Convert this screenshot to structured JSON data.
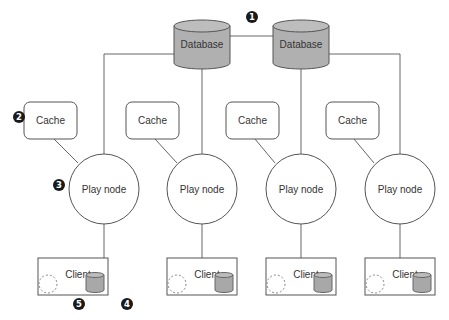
{
  "diagram": {
    "databases": [
      {
        "label": "Database",
        "cx": 202,
        "top": 20
      },
      {
        "label": "Database",
        "cx": 301,
        "top": 20
      }
    ],
    "caches": [
      {
        "label": "Cache",
        "x": 24,
        "y": 102
      },
      {
        "label": "Cache",
        "x": 126,
        "y": 102
      },
      {
        "label": "Cache",
        "x": 226,
        "y": 102
      },
      {
        "label": "Cache",
        "x": 326,
        "y": 102
      }
    ],
    "play_nodes": [
      {
        "label": "Play node",
        "cx": 104,
        "cy": 189
      },
      {
        "label": "Play node",
        "cx": 202,
        "cy": 189
      },
      {
        "label": "Play node",
        "cx": 301,
        "cy": 189
      },
      {
        "label": "Play node",
        "cx": 400,
        "cy": 189
      }
    ],
    "clients": [
      {
        "label": "Client",
        "x": 38,
        "y": 258
      },
      {
        "label": "Client",
        "x": 167,
        "y": 258
      },
      {
        "label": "Client",
        "x": 266,
        "y": 258
      },
      {
        "label": "Client",
        "x": 365,
        "y": 258
      }
    ],
    "badges": [
      {
        "num": "1",
        "x": 252,
        "y": 17
      },
      {
        "num": "2",
        "x": 19,
        "y": 117
      },
      {
        "num": "3",
        "x": 59,
        "y": 185
      },
      {
        "num": "4",
        "x": 127,
        "y": 304
      },
      {
        "num": "5",
        "x": 79,
        "y": 304
      }
    ],
    "colors": {
      "db_fill": "#b0b0b0",
      "line": "#555555",
      "badge": "#1a1a1a"
    }
  }
}
